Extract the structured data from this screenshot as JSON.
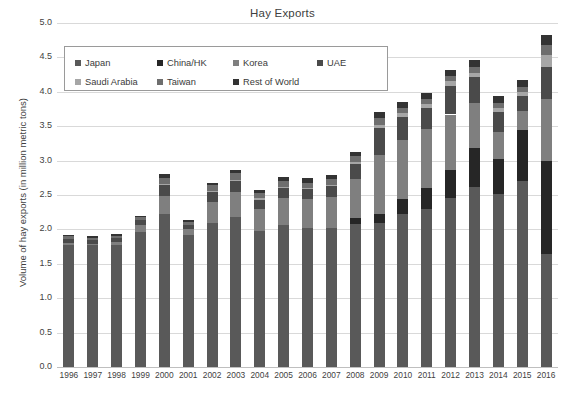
{
  "chart_data": {
    "type": "bar",
    "subtype": "stacked-column",
    "title": "Hay Exports",
    "xlabel": "",
    "ylabel": "Volume of hay exports (in million metric tons)",
    "ylim": [
      0.0,
      5.0
    ],
    "ytick_step": 0.5,
    "ytick_labels": [
      "0.0",
      "0.5",
      "1.0",
      "1.5",
      "2.0",
      "2.5",
      "3.0",
      "3.5",
      "4.0",
      "4.5",
      "5.0"
    ],
    "grid": true,
    "legend_position": "upper-left-inside",
    "categories": [
      "1996",
      "1997",
      "1998",
      "1999",
      "2000",
      "2001",
      "2002",
      "2003",
      "2004",
      "2005",
      "2006",
      "2007",
      "2008",
      "2009",
      "2010",
      "2011",
      "2012",
      "2013",
      "2014",
      "2015",
      "2016"
    ],
    "series": [
      {
        "name": "Japan",
        "color": "#595959",
        "values": [
          1.78,
          1.77,
          1.78,
          1.96,
          2.22,
          1.92,
          2.1,
          2.18,
          1.97,
          2.07,
          2.02,
          2.02,
          2.08,
          2.1,
          2.22,
          2.3,
          2.45,
          2.62,
          2.52,
          2.7,
          1.64
        ]
      },
      {
        "name": "China/HK",
        "color": "#262626",
        "values": [
          0.0,
          0.0,
          0.0,
          0.0,
          0.0,
          0.0,
          0.0,
          0.0,
          0.0,
          0.0,
          0.0,
          0.0,
          0.09,
          0.12,
          0.22,
          0.3,
          0.42,
          0.56,
          0.5,
          0.74,
          1.36
        ]
      },
      {
        "name": "Korea",
        "color": "#7f7f7f",
        "values": [
          0.02,
          0.02,
          0.03,
          0.1,
          0.26,
          0.08,
          0.3,
          0.36,
          0.32,
          0.39,
          0.42,
          0.45,
          0.56,
          0.86,
          0.86,
          0.86,
          0.8,
          0.66,
          0.39,
          0.28,
          0.9
        ]
      },
      {
        "name": "UAE",
        "color": "#4a4a4a",
        "values": [
          0.06,
          0.05,
          0.06,
          0.08,
          0.16,
          0.07,
          0.14,
          0.16,
          0.14,
          0.14,
          0.14,
          0.16,
          0.22,
          0.4,
          0.34,
          0.3,
          0.42,
          0.38,
          0.3,
          0.22,
          0.46
        ]
      },
      {
        "name": "Saudi Arabia",
        "color": "#a6a6a6",
        "values": [
          0.0,
          0.0,
          0.0,
          0.0,
          0.02,
          0.0,
          0.02,
          0.02,
          0.02,
          0.02,
          0.02,
          0.02,
          0.03,
          0.04,
          0.05,
          0.06,
          0.06,
          0.06,
          0.05,
          0.05,
          0.18
        ]
      },
      {
        "name": "Taiwan",
        "color": "#6e6e6e",
        "values": [
          0.04,
          0.04,
          0.04,
          0.04,
          0.08,
          0.04,
          0.08,
          0.1,
          0.08,
          0.09,
          0.08,
          0.08,
          0.09,
          0.1,
          0.08,
          0.08,
          0.08,
          0.08,
          0.08,
          0.08,
          0.14
        ]
      },
      {
        "name": "Rest of World",
        "color": "#333333",
        "values": [
          0.02,
          0.02,
          0.02,
          0.02,
          0.06,
          0.02,
          0.04,
          0.04,
          0.04,
          0.05,
          0.06,
          0.06,
          0.06,
          0.09,
          0.08,
          0.08,
          0.08,
          0.1,
          0.1,
          0.1,
          0.14
        ]
      }
    ],
    "totals": [
      1.92,
      1.9,
      1.93,
      2.2,
      2.8,
      2.13,
      2.68,
      2.86,
      2.57,
      2.76,
      2.74,
      2.79,
      3.13,
      3.71,
      3.85,
      3.98,
      4.31,
      4.46,
      3.94,
      4.17,
      4.82
    ]
  },
  "legend": {
    "items": [
      {
        "label": "Japan"
      },
      {
        "label": "China/HK"
      },
      {
        "label": "Korea"
      },
      {
        "label": "UAE"
      },
      {
        "label": "Saudi Arabia"
      },
      {
        "label": "Taiwan"
      },
      {
        "label": "Rest of World"
      }
    ]
  }
}
